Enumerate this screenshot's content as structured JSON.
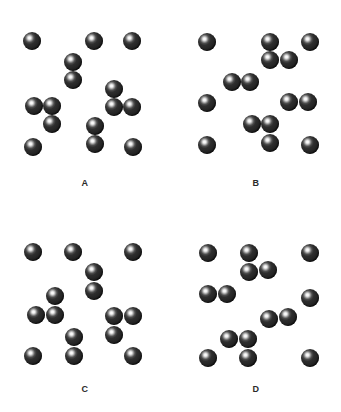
{
  "figure": {
    "title": "",
    "background_color": "#ffffff",
    "sphere_color": "#232323",
    "highlight_color": "#ffffff",
    "label_color": "#2a2a2a",
    "sphere_diameter": 18,
    "panel_width": 170,
    "panel_height": 206
  },
  "panels": [
    {
      "label": "A",
      "label_y": 178,
      "origin": {
        "x": 0,
        "y": 0
      },
      "particles": [
        {
          "x": 32,
          "y": 41,
          "group": "single-1"
        },
        {
          "x": 94,
          "y": 41,
          "group": "single-2"
        },
        {
          "x": 132,
          "y": 41,
          "group": "single-3"
        },
        {
          "x": 73,
          "y": 62,
          "group": "pair-1"
        },
        {
          "x": 73,
          "y": 80,
          "group": "pair-1"
        },
        {
          "x": 114,
          "y": 89,
          "group": "tri-1"
        },
        {
          "x": 114,
          "y": 107,
          "group": "tri-1"
        },
        {
          "x": 132,
          "y": 107,
          "group": "tri-1"
        },
        {
          "x": 34,
          "y": 106,
          "group": "tri-2"
        },
        {
          "x": 52,
          "y": 106,
          "group": "tri-2"
        },
        {
          "x": 52,
          "y": 124,
          "group": "tri-2"
        },
        {
          "x": 95,
          "y": 126,
          "group": "pair-2"
        },
        {
          "x": 95,
          "y": 144,
          "group": "pair-2"
        },
        {
          "x": 33,
          "y": 147,
          "group": "single-4"
        },
        {
          "x": 133,
          "y": 147,
          "group": "single-5"
        }
      ],
      "counts": {
        "monomers": 5,
        "dimers": 2,
        "trimers": 2,
        "total_spheres": 15
      }
    },
    {
      "label": "B",
      "label_y": 178,
      "origin": {
        "x": 171,
        "y": 0
      },
      "particles": [
        {
          "x": 36,
          "y": 42,
          "group": "single-1"
        },
        {
          "x": 99,
          "y": 42,
          "group": "tri-1"
        },
        {
          "x": 99,
          "y": 60,
          "group": "tri-1"
        },
        {
          "x": 118,
          "y": 60,
          "group": "tri-1"
        },
        {
          "x": 139,
          "y": 42,
          "group": "single-2"
        },
        {
          "x": 61,
          "y": 82,
          "group": "pair-1"
        },
        {
          "x": 79,
          "y": 82,
          "group": "pair-1"
        },
        {
          "x": 36,
          "y": 103,
          "group": "single-3"
        },
        {
          "x": 118,
          "y": 102,
          "group": "pair-2"
        },
        {
          "x": 137,
          "y": 102,
          "group": "pair-2"
        },
        {
          "x": 81,
          "y": 124,
          "group": "tri-2"
        },
        {
          "x": 99,
          "y": 124,
          "group": "tri-2"
        },
        {
          "x": 99,
          "y": 143,
          "group": "tri-2"
        },
        {
          "x": 36,
          "y": 145,
          "group": "single-4"
        },
        {
          "x": 139,
          "y": 145,
          "group": "single-5"
        }
      ],
      "counts": {
        "monomers": 5,
        "dimers": 2,
        "trimers": 2,
        "total_spheres": 15
      }
    },
    {
      "label": "C",
      "label_y": 178,
      "origin": {
        "x": 0,
        "y": 206
      },
      "particles": [
        {
          "x": 33,
          "y": 46,
          "group": "single-1"
        },
        {
          "x": 73,
          "y": 46,
          "group": "single-2"
        },
        {
          "x": 133,
          "y": 46,
          "group": "single-3"
        },
        {
          "x": 94,
          "y": 66,
          "group": "pair-1"
        },
        {
          "x": 94,
          "y": 85,
          "group": "pair-1"
        },
        {
          "x": 55,
          "y": 90,
          "group": "tri-1"
        },
        {
          "x": 36,
          "y": 109,
          "group": "tri-1"
        },
        {
          "x": 55,
          "y": 109,
          "group": "tri-1"
        },
        {
          "x": 114,
          "y": 110,
          "group": "tri-2"
        },
        {
          "x": 133,
          "y": 110,
          "group": "tri-2"
        },
        {
          "x": 114,
          "y": 129,
          "group": "tri-2"
        },
        {
          "x": 74,
          "y": 131,
          "group": "pair-2"
        },
        {
          "x": 74,
          "y": 150,
          "group": "pair-2"
        },
        {
          "x": 33,
          "y": 150,
          "group": "single-4"
        },
        {
          "x": 133,
          "y": 150,
          "group": "single-5"
        }
      ],
      "counts": {
        "monomers": 5,
        "dimers": 2,
        "trimers": 2,
        "total_spheres": 15
      }
    },
    {
      "label": "D",
      "label_y": 178,
      "origin": {
        "x": 171,
        "y": 206
      },
      "particles": [
        {
          "x": 37,
          "y": 47,
          "group": "single-1"
        },
        {
          "x": 139,
          "y": 47,
          "group": "single-2"
        },
        {
          "x": 78,
          "y": 47,
          "group": "tri-1"
        },
        {
          "x": 78,
          "y": 66,
          "group": "tri-1"
        },
        {
          "x": 97,
          "y": 64,
          "group": "tri-1"
        },
        {
          "x": 37,
          "y": 88,
          "group": "pair-1"
        },
        {
          "x": 56,
          "y": 88,
          "group": "pair-1"
        },
        {
          "x": 139,
          "y": 92,
          "group": "single-3"
        },
        {
          "x": 98,
          "y": 113,
          "group": "pair-2"
        },
        {
          "x": 117,
          "y": 111,
          "group": "pair-2"
        },
        {
          "x": 58,
          "y": 133,
          "group": "tri-2"
        },
        {
          "x": 77,
          "y": 133,
          "group": "tri-2"
        },
        {
          "x": 77,
          "y": 152,
          "group": "tri-2"
        },
        {
          "x": 37,
          "y": 152,
          "group": "single-4"
        },
        {
          "x": 139,
          "y": 152,
          "group": "single-5"
        }
      ],
      "counts": {
        "monomers": 5,
        "dimers": 2,
        "trimers": 2,
        "total_spheres": 15
      }
    }
  ]
}
